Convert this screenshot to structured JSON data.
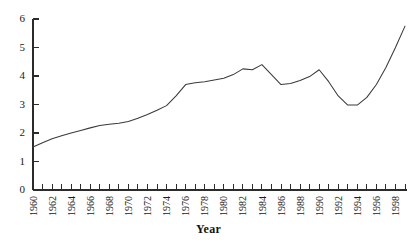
{
  "chart_data": {
    "type": "line",
    "title": "",
    "subtitle": "",
    "xlabel": "Year",
    "ylabel": "",
    "xlim": [
      1960,
      1999
    ],
    "ylim": [
      0,
      6
    ],
    "grid": false,
    "legend": null,
    "legend_position": "none",
    "y_ticks": [
      0,
      1,
      2,
      3,
      4,
      5,
      6
    ],
    "y_tick_labels": [
      "0",
      "1",
      "2",
      "3",
      "4",
      "5",
      "6"
    ],
    "x_tick_labels": [
      "1960",
      "1962",
      "1964",
      "1966",
      "1968",
      "1970",
      "1972",
      "1974",
      "1976",
      "1978",
      "1980",
      "1982",
      "1984",
      "1986",
      "1988",
      "1990",
      "1992",
      "1994",
      "1996",
      "1998"
    ],
    "x_minor_tick_interval": 1,
    "x_label_interval": 2,
    "line_color": "#3a3a3a",
    "axis_color": "#2b2b2b",
    "background_color": "#ffffff",
    "x": [
      1960,
      1961,
      1962,
      1963,
      1964,
      1965,
      1966,
      1967,
      1968,
      1969,
      1970,
      1971,
      1972,
      1973,
      1974,
      1975,
      1976,
      1977,
      1978,
      1979,
      1980,
      1981,
      1982,
      1983,
      1984,
      1985,
      1986,
      1987,
      1988,
      1989,
      1990,
      1991,
      1992,
      1993,
      1994,
      1995,
      1996,
      1997,
      1998,
      1999
    ],
    "values": [
      1.51,
      1.66,
      1.8,
      1.9,
      2.0,
      2.09,
      2.18,
      2.26,
      2.31,
      2.34,
      2.4,
      2.52,
      2.65,
      2.8,
      2.96,
      3.3,
      3.7,
      3.76,
      3.8,
      3.86,
      3.92,
      4.05,
      4.25,
      4.22,
      4.4,
      4.05,
      3.7,
      3.74,
      3.84,
      3.98,
      4.22,
      3.8,
      3.3,
      2.98,
      2.98,
      3.25,
      3.7,
      4.3,
      5.0,
      5.75
    ],
    "series": [
      {
        "name": "series-1",
        "values": [
          1.51,
          1.66,
          1.8,
          1.9,
          2.0,
          2.09,
          2.18,
          2.26,
          2.31,
          2.34,
          2.4,
          2.52,
          2.65,
          2.8,
          2.96,
          3.3,
          3.7,
          3.76,
          3.8,
          3.86,
          3.92,
          4.05,
          4.25,
          4.22,
          4.4,
          4.05,
          3.7,
          3.74,
          3.84,
          3.98,
          4.22,
          3.8,
          3.3,
          2.98,
          2.98,
          3.25,
          3.7,
          4.3,
          5.0,
          5.75
        ]
      }
    ]
  },
  "axis": {
    "x_title": "Year"
  }
}
